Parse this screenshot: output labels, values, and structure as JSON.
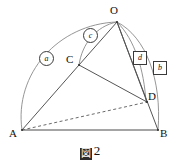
{
  "figure": {
    "caption_glyph": "図",
    "caption_number": "2",
    "stroke_color": "#555555",
    "arc_color": "#8a8a8a",
    "baseline_color": "#4a4a4a",
    "dashed_color": "#6a6a6a"
  },
  "points": [
    {
      "id": "O",
      "label": "O",
      "x": 117,
      "y": 22,
      "label_x": 110,
      "label_y": 6
    },
    {
      "id": "C",
      "label": "C",
      "x": 79,
      "y": 65,
      "label_x": 67,
      "label_y": 55
    },
    {
      "id": "D",
      "label": "D",
      "x": 147,
      "y": 102,
      "label_x": 146,
      "label_y": 92
    },
    {
      "id": "A",
      "label": "A",
      "x": 22,
      "y": 130,
      "label_x": 10,
      "label_y": 130
    },
    {
      "id": "B",
      "label": "B",
      "x": 158,
      "y": 130,
      "label_x": 158,
      "label_y": 130
    }
  ],
  "segments": [
    {
      "id": "A-B",
      "from": "A",
      "to": "B",
      "style": "solid"
    },
    {
      "id": "A-C",
      "from": "A",
      "to": "C",
      "style": "solid"
    },
    {
      "id": "A-D",
      "from": "A",
      "to": "D",
      "style": "dashed"
    },
    {
      "id": "C-D",
      "from": "C",
      "to": "D",
      "style": "solid"
    },
    {
      "id": "C-O",
      "from": "C",
      "to": "O",
      "style": "solid"
    },
    {
      "id": "O-D",
      "from": "O",
      "to": "D",
      "style": "solid"
    },
    {
      "id": "O-B",
      "from": "O",
      "to": "B",
      "style": "solid"
    }
  ],
  "arcs": [
    {
      "id": "arc-a",
      "label": "a",
      "marker": "circled",
      "from": "A",
      "to": "O",
      "label_x": 39,
      "label_y": 52
    },
    {
      "id": "arc-c",
      "label": "c",
      "marker": "circled",
      "from": "C",
      "to": "O",
      "label_x": 83,
      "label_y": 29
    },
    {
      "id": "arc-d",
      "label": "d",
      "marker": "boxed",
      "from": "O",
      "to": "D",
      "label_x": 133,
      "label_y": 52
    },
    {
      "id": "arc-b",
      "label": "b",
      "marker": "boxed",
      "from": "O",
      "to": "B",
      "label_x": 153,
      "label_y": 62
    }
  ]
}
